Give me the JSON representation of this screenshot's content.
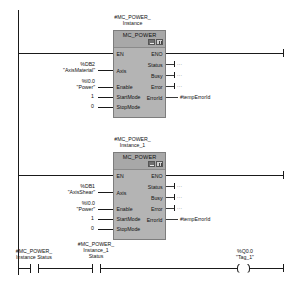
{
  "editor": {
    "type": "ladder-logic-lad",
    "top_clipped_text": "",
    "symbol_quote": "\""
  },
  "networks": [
    {
      "id": "network-1",
      "instance_name": "#MC_POWER_\nInstance",
      "block_title": "MC_POWER",
      "header_icons": [
        "block-call-icon",
        "block-properties-icon"
      ],
      "inputs": [
        {
          "pin": "EN",
          "operand_addr": "",
          "operand_sym": "",
          "const": "",
          "type": "power"
        },
        {
          "pin": "Axis",
          "operand_addr": "%DB2",
          "operand_sym": "\"AxisMaterial\"",
          "const": "",
          "type": "operand"
        },
        {
          "pin": "Enable",
          "operand_addr": "%I0.0",
          "operand_sym": "\"Power\"",
          "const": "",
          "type": "operand"
        },
        {
          "pin": "StartMode",
          "operand_addr": "",
          "operand_sym": "",
          "const": "1",
          "type": "const"
        },
        {
          "pin": "StopMode",
          "operand_addr": "",
          "operand_sym": "",
          "const": "0",
          "type": "const"
        }
      ],
      "outputs": [
        {
          "pin": "ENO",
          "operand": "",
          "type": "power"
        },
        {
          "pin": "Status",
          "operand": "...",
          "type": "dots"
        },
        {
          "pin": "Busy",
          "operand": "...",
          "type": "dots"
        },
        {
          "pin": "Error",
          "operand": "...",
          "type": "dots"
        },
        {
          "pin": "ErrorId",
          "operand": "#tempErrorId",
          "type": "operand"
        }
      ]
    },
    {
      "id": "network-2",
      "instance_name": "#MC_POWER_\nInstance_1",
      "block_title": "MC_POWER",
      "header_icons": [
        "block-call-icon",
        "block-properties-icon"
      ],
      "inputs": [
        {
          "pin": "EN",
          "operand_addr": "",
          "operand_sym": "",
          "const": "",
          "type": "power"
        },
        {
          "pin": "Axis",
          "operand_addr": "%DB1",
          "operand_sym": "\"AxisShear\"",
          "const": "",
          "type": "operand"
        },
        {
          "pin": "Enable",
          "operand_addr": "%I0.0",
          "operand_sym": "\"Power\"",
          "const": "",
          "type": "operand"
        },
        {
          "pin": "StartMode",
          "operand_addr": "",
          "operand_sym": "",
          "const": "1",
          "type": "const"
        },
        {
          "pin": "StopMode",
          "operand_addr": "",
          "operand_sym": "",
          "const": "0",
          "type": "const"
        }
      ],
      "outputs": [
        {
          "pin": "ENO",
          "operand": "",
          "type": "power"
        },
        {
          "pin": "Status",
          "operand": "...",
          "type": "dots"
        },
        {
          "pin": "Busy",
          "operand": "...",
          "type": "dots"
        },
        {
          "pin": "Error",
          "operand": "...",
          "type": "dots"
        },
        {
          "pin": "ErrorId",
          "operand": "#tempErrorId",
          "type": "operand"
        }
      ]
    },
    {
      "id": "network-3",
      "elements": [
        {
          "kind": "contact-no",
          "label": "#MC_POWER_\nInstance Status"
        },
        {
          "kind": "contact-no",
          "label": "#MC_POWER_\nInstance_1\nStatus"
        },
        {
          "kind": "coil",
          "label": "%Q0.0\n\"Tag_1\""
        }
      ]
    }
  ]
}
